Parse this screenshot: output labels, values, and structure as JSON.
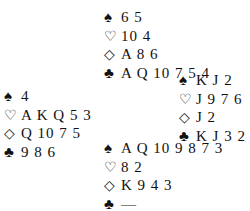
{
  "diagram": {
    "type": "bridge-deal",
    "north": {
      "spades": "6 5",
      "hearts": "10 4",
      "diamonds": "A 8 6",
      "clubs": "A Q 10 7 5 4"
    },
    "west": {
      "spades": "4",
      "hearts": "A K Q 5 3",
      "diamonds": "Q 10 7 5",
      "clubs": "9 8 6"
    },
    "east": {
      "spades": "K J 2",
      "hearts": "J 9 7 6",
      "diamonds": "J 2",
      "clubs": "K J 3 2"
    },
    "south": {
      "spades": "A Q 10 9 8 7 3",
      "hearts": "8 2",
      "diamonds": "K 9 4 3",
      "clubs": "—"
    },
    "symbols": {
      "spades": "♠",
      "hearts": "♡",
      "diamonds": "◇",
      "clubs": "♣"
    }
  }
}
